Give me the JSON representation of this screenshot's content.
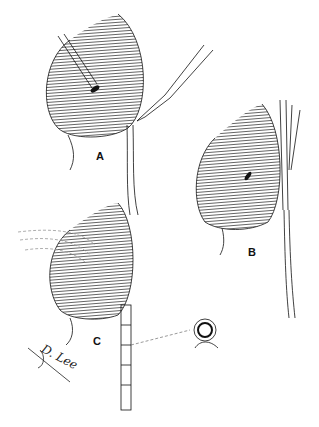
{
  "figure": {
    "panels": [
      {
        "id": "A",
        "label": "A",
        "description": "Bladder with catheter and scalpel incising urethra/duct"
      },
      {
        "id": "B",
        "label": "B",
        "description": "Bladder with incision and forceps inserted along duct"
      },
      {
        "id": "C",
        "label": "C",
        "description": "Bladder with tube sutured in place along duct, cross-section detail"
      }
    ],
    "signature": "D. Lee",
    "detail_callout": "cross-section-of-tube",
    "colors": {
      "ink": "#111111",
      "background": "#ffffff"
    }
  }
}
